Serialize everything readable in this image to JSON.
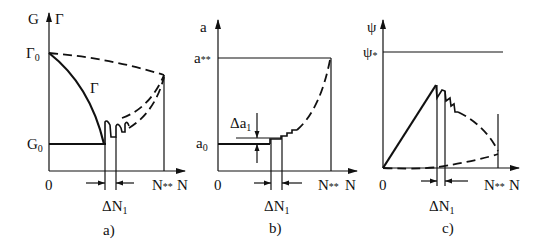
{
  "figure": {
    "panels": [
      {
        "id": "a",
        "caption": "a)",
        "y_axis_label_left": "G",
        "y_axis_label_right": "Γ",
        "x_axis_label": "N",
        "origin_label": "0",
        "tick_labels": {
          "gamma0": {
            "main": "Γ",
            "sub": "0"
          },
          "g0": {
            "main": "G",
            "sub": "0"
          },
          "n_star": {
            "main": "N",
            "sub": "**"
          }
        },
        "curve_label": "Γ",
        "interval_label": {
          "main": "ΔN",
          "sub": "1"
        }
      },
      {
        "id": "b",
        "caption": "b)",
        "y_axis_label": "a",
        "x_axis_label": "N",
        "origin_label": "0",
        "tick_labels": {
          "a_star": {
            "main": "a",
            "sub": "**"
          },
          "a0": {
            "main": "a",
            "sub": "0"
          },
          "n_star": {
            "main": "N",
            "sub": "**"
          }
        },
        "increment_label": {
          "main": "Δa",
          "sub": "1"
        },
        "interval_label": {
          "main": "ΔN",
          "sub": "1"
        }
      },
      {
        "id": "c",
        "caption": "c)",
        "y_axis_label": "ψ",
        "x_axis_label": "N",
        "origin_label": "0",
        "tick_labels": {
          "psi_star": {
            "main": "ψ",
            "sub": "*"
          },
          "n_star": {
            "main": "N",
            "sub": "**"
          }
        },
        "interval_label": {
          "main": "ΔN",
          "sub": "1"
        }
      }
    ]
  }
}
